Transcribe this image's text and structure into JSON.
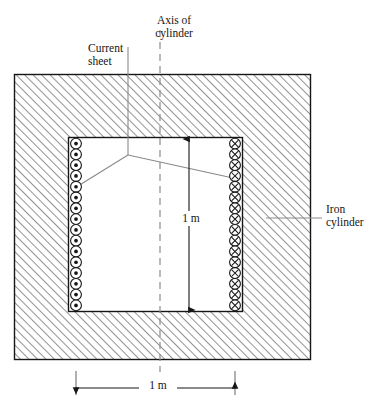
{
  "figure": {
    "title_visible": false,
    "labels": {
      "axis_of_cylinder": "Axis of\ncylinder",
      "current_sheet": "Current\nsheet",
      "iron_cylinder": "Iron\ncylinder",
      "dimension_vertical": "1 m",
      "dimension_horizontal": "1 m"
    },
    "colors": {
      "outline": "#161616",
      "hatch": "#8a8a8a",
      "leader": "#8a8a8a",
      "dash": "#8a8a8a",
      "interior": "#ffffff",
      "background": "#ffffff"
    },
    "geometry": {
      "outer_rect": {
        "x": 14,
        "y": 74,
        "width": 297,
        "height": 286
      },
      "inner_rect": {
        "x": 68,
        "y": 137,
        "width": 175,
        "height": 175
      },
      "axis_x": 160,
      "axis_top_y": 30,
      "axis_bottom_y": 372,
      "current_sheet_leader_x": 128,
      "current_sheet_leader_top_y": 47,
      "vertex": {
        "x": 128,
        "y": 155
      }
    },
    "current_sheets": {
      "left": {
        "symbol": "dot",
        "meaning": "current-out-of-page",
        "count": 16,
        "column_x": 76,
        "radius": 5.4
      },
      "right": {
        "symbol": "cross",
        "meaning": "current-into-page",
        "count": 16,
        "column_x": 235,
        "radius": 5.4
      }
    },
    "dimensions": {
      "vertical": {
        "label": "1 m",
        "x": 189,
        "y1": 139,
        "y2": 310
      },
      "horizontal": {
        "label": "1 m",
        "y": 388,
        "x1": 76,
        "x2": 235
      }
    }
  }
}
